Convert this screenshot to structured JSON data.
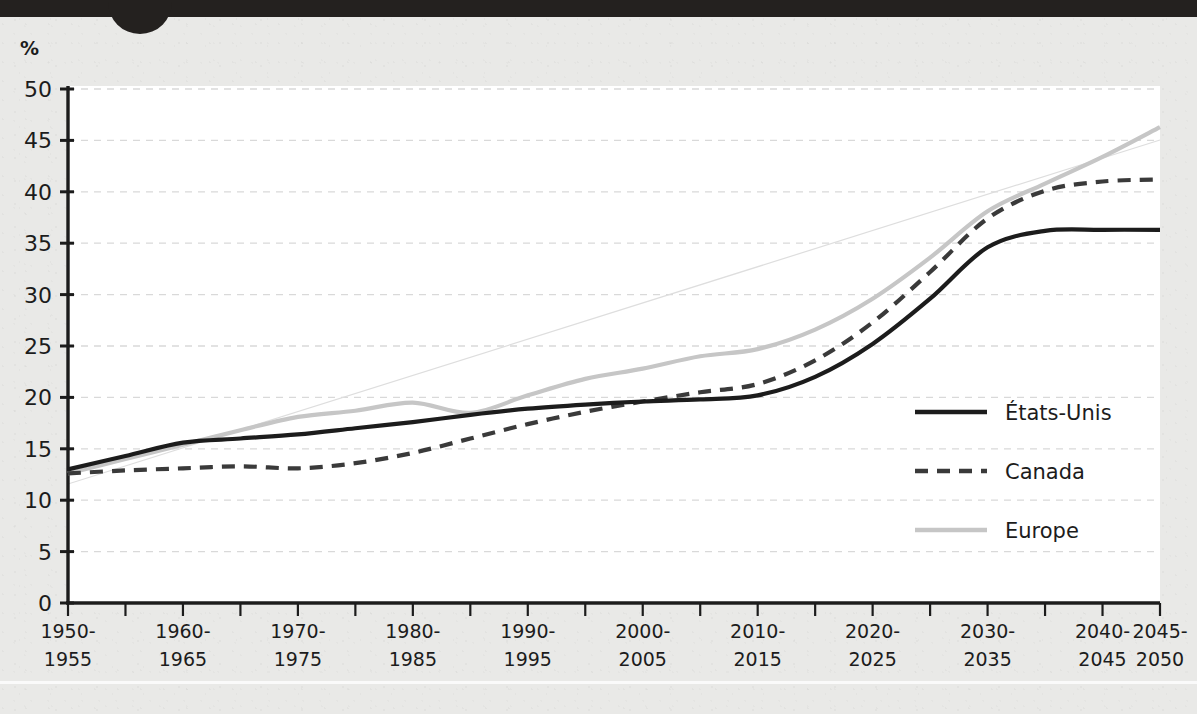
{
  "page": {
    "background_color": "#e9e9e7",
    "plot_background_color": "#ffffff",
    "top_band_color": "#24211f"
  },
  "chart_data": {
    "type": "line",
    "title": "",
    "subtitle": "",
    "xlabel": "",
    "ylabel": "",
    "unit_label": "%",
    "ylim": [
      0,
      50
    ],
    "ytick_values": [
      0,
      5,
      10,
      15,
      20,
      25,
      30,
      35,
      40,
      45,
      50
    ],
    "ytick_labels": [
      "0",
      "5",
      "10",
      "15",
      "20",
      "25",
      "30",
      "35",
      "40",
      "45",
      "50"
    ],
    "grid": true,
    "grid_style": "dashed-horizontal",
    "legend_position": "center-right",
    "categories": [
      "1950-1955",
      "1955-1960",
      "1960-1965",
      "1965-1970",
      "1970-1975",
      "1975-1980",
      "1980-1985",
      "1985-1990",
      "1990-1995",
      "1995-2000",
      "2000-2005",
      "2005-2010",
      "2010-2015",
      "2015-2020",
      "2020-2025",
      "2025-2030",
      "2030-2035",
      "2035-2040",
      "2040-2045",
      "2045-2050"
    ],
    "xtick_labels": [
      {
        "line1": "1950-",
        "line2": "1955",
        "index": 0
      },
      {
        "line1": "1960-",
        "line2": "1965",
        "index": 2
      },
      {
        "line1": "1970-",
        "line2": "1975",
        "index": 4
      },
      {
        "line1": "1980-",
        "line2": "1985",
        "index": 6
      },
      {
        "line1": "1990-",
        "line2": "1995",
        "index": 8
      },
      {
        "line1": "2000-",
        "line2": "2005",
        "index": 10
      },
      {
        "line1": "2010-",
        "line2": "2015",
        "index": 12
      },
      {
        "line1": "2020-",
        "line2": "2025",
        "index": 14
      },
      {
        "line1": "2030-",
        "line2": "2035",
        "index": 16
      },
      {
        "line1": "2040-",
        "line2": "2045",
        "index": 18
      },
      {
        "line1": "2045-",
        "line2": "2050",
        "index": 19
      }
    ],
    "series": [
      {
        "name": "États-Unis",
        "style": "solid",
        "color": "#1c1c1c",
        "width": 4.2,
        "values": [
          13.0,
          14.3,
          15.6,
          16.0,
          16.4,
          17.0,
          17.6,
          18.3,
          18.9,
          19.3,
          19.6,
          19.8,
          20.2,
          22.0,
          25.2,
          29.6,
          34.6,
          36.2,
          36.3,
          36.3
        ]
      },
      {
        "name": "Canada",
        "style": "dashed",
        "color": "#3a3a3a",
        "width": 4.2,
        "values": [
          12.6,
          12.9,
          13.1,
          13.3,
          13.1,
          13.6,
          14.6,
          16.0,
          17.4,
          18.6,
          19.6,
          20.5,
          21.3,
          23.6,
          27.3,
          32.2,
          37.4,
          40.1,
          41.0,
          41.2
        ]
      },
      {
        "name": "Europe",
        "style": "solid",
        "color": "#c6c6c6",
        "width": 4.2,
        "values": [
          12.6,
          14.0,
          15.4,
          16.8,
          18.1,
          18.7,
          19.5,
          18.5,
          20.2,
          21.8,
          22.8,
          24.0,
          24.7,
          26.6,
          29.6,
          33.6,
          38.1,
          40.8,
          43.4,
          46.3
        ]
      }
    ]
  },
  "legend": {
    "items": [
      {
        "label": "États-Unis",
        "style": "solid",
        "color": "#1c1c1c"
      },
      {
        "label": "Canada",
        "style": "dashed",
        "color": "#3a3a3a"
      },
      {
        "label": "Europe",
        "style": "solid",
        "color": "#c6c6c6"
      }
    ]
  }
}
